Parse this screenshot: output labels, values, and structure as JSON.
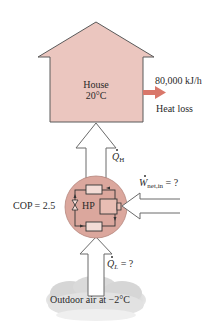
{
  "house": {
    "name": "House",
    "temperature": "20°C",
    "fill_color": "#ebc6bf"
  },
  "heat_loss": {
    "rate": "80,000 kJ/h",
    "label": "Heat loss",
    "arrow_color": "#d9776a"
  },
  "heat_to_house": {
    "symbol": "Q",
    "subscript": "H"
  },
  "heat_pump": {
    "label": "HP",
    "cop_label": "COP = 2.5",
    "fill_color": "#dba79d"
  },
  "work_input": {
    "symbol": "W",
    "subscript": "net,in",
    "value": " = ?"
  },
  "heat_from_outdoor": {
    "symbol": "Q",
    "subscript": "L",
    "value": " = ?"
  },
  "outdoor": {
    "label": "Outdoor air at −2°C"
  }
}
